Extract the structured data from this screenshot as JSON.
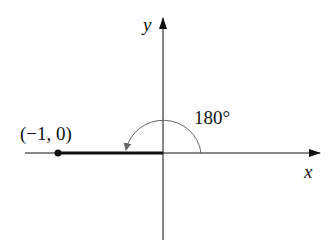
{
  "diagram": {
    "axes": {
      "x_label": "x",
      "y_label": "y"
    },
    "point": {
      "label": "(−1, 0)",
      "x": -1,
      "y": 0
    },
    "angle": {
      "label": "180°",
      "degrees": 180,
      "direction": "counterclockwise"
    },
    "colors": {
      "axis": "#111111",
      "arc": "#666666",
      "terminal_side": "#111111"
    }
  }
}
